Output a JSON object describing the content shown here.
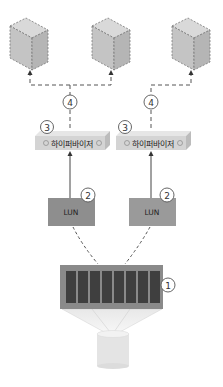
{
  "diagram": {
    "servers": [
      {
        "id": "server-1",
        "icon": "server-tower-icon"
      },
      {
        "id": "server-2",
        "icon": "server-tower-icon"
      },
      {
        "id": "server-3",
        "icon": "server-tower-icon"
      }
    ],
    "hypervisors": [
      {
        "label": "하이퍼바이저",
        "marker": "3"
      },
      {
        "label": "하이퍼바이저",
        "marker": "3"
      }
    ],
    "luns": [
      {
        "label": "LUN",
        "marker": "2"
      },
      {
        "label": "LUN",
        "marker": "2"
      }
    ],
    "network_markers": [
      "4",
      "4"
    ],
    "storage_array": {
      "marker": "1",
      "disk_count": 8
    },
    "storage_pool": {
      "icon": "database-cylinder-icon"
    },
    "colors": {
      "server_fill": "#c9c9c9",
      "dashed_line": "#555555",
      "hypervisor_fill": "#d6d6d6",
      "lun_fill": "#8e8e8e",
      "array_fill": "#8a8a8a",
      "disk_fill": "#3f3f3f",
      "cylinder_fill": "#e6e6e6"
    }
  }
}
